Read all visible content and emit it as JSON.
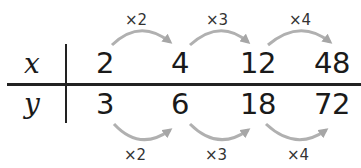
{
  "table": {
    "rows": [
      {
        "label": "x",
        "values": [
          "2",
          "4",
          "12",
          "48"
        ]
      },
      {
        "label": "y",
        "values": [
          "3",
          "6",
          "18",
          "72"
        ]
      }
    ]
  },
  "top_multipliers": [
    "×2",
    "×3",
    "×4"
  ],
  "bottom_multipliers": [
    "×2",
    "×3",
    "×4"
  ],
  "colors": {
    "text": "#1a1a1a",
    "lines": "#222222",
    "arrows": "#a6a6a6"
  }
}
